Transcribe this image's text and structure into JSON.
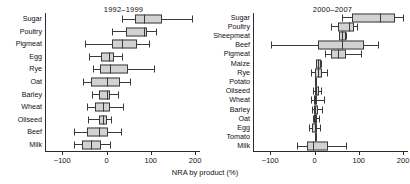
{
  "figure": {
    "xlabel": "NRA by product (%)"
  },
  "chart_data": [
    {
      "type": "box",
      "title": "1992–1999",
      "panel": "left",
      "xlabel": "NRA by product (%)",
      "ylabel": "",
      "xlim": [
        -140,
        210
      ],
      "xticks": [
        -100,
        0,
        100,
        200
      ],
      "xticklabels": [
        "−100",
        "0",
        "100",
        "200"
      ],
      "grid": false,
      "categories": [
        "Sugar",
        "Poultry",
        "Pigmeat",
        "Egg",
        "Rye",
        "Oat",
        "Barley",
        "Wheat",
        "Oilseed",
        "Beef",
        "Milk"
      ],
      "boxes": [
        {
          "label": "Sugar",
          "whisker_low": 36,
          "q1": 65,
          "median": 84,
          "q3": 126,
          "whisker_high": 192
        },
        {
          "label": "Poultry",
          "whisker_low": 12,
          "q1": 45,
          "median": 84,
          "q3": 92,
          "whisker_high": 111
        },
        {
          "label": "Pigmeat",
          "whisker_low": -48,
          "q1": 13,
          "median": 34,
          "q3": 69,
          "whisker_high": 95
        },
        {
          "label": "Egg",
          "whisker_low": -39,
          "q1": -12,
          "median": 5,
          "q3": 18,
          "whisker_high": 34
        },
        {
          "label": "Rye",
          "whisker_low": -30,
          "q1": -14,
          "median": 9,
          "q3": 49,
          "whisker_high": 107
        },
        {
          "label": "Oat",
          "whisker_low": -53,
          "q1": -35,
          "median": 0,
          "q3": 30,
          "whisker_high": 53
        },
        {
          "label": "Barley",
          "whisker_low": -33,
          "q1": -16,
          "median": 0,
          "q3": 9,
          "whisker_high": 26
        },
        {
          "label": "Wheat",
          "whisker_low": -45,
          "q1": -25,
          "median": -8,
          "q3": 9,
          "whisker_high": 38
        },
        {
          "label": "Oilseed",
          "whisker_low": -41,
          "q1": -18,
          "median": -8,
          "q3": 1,
          "whisker_high": 11
        },
        {
          "label": "Beef",
          "whisker_low": -74,
          "q1": -43,
          "median": -18,
          "q3": 3,
          "whisker_high": 32
        },
        {
          "label": "Milk",
          "whisker_low": -74,
          "q1": -55,
          "median": -35,
          "q3": -12,
          "whisker_high": 7
        }
      ]
    },
    {
      "type": "box",
      "title": "2000–2007",
      "panel": "right",
      "xlabel": "NRA by product (%)",
      "ylabel": "",
      "xlim": [
        -140,
        210
      ],
      "xticks": [
        -100,
        0,
        100,
        200
      ],
      "xticklabels": [
        "−100",
        "0",
        "100",
        "200"
      ],
      "grid": false,
      "categories": [
        "Sugar",
        "Poultry",
        "Sheepmeat",
        "Beef",
        "Pigmeat",
        "Maize",
        "Rye",
        "Potato",
        "Oilseed",
        "Wheat",
        "Barley",
        "Oat",
        "Egg",
        "Tomato",
        "Milk"
      ],
      "boxes": [
        {
          "label": "Sugar",
          "whisker_low": 63,
          "q1": 85,
          "median": 147,
          "q3": 182,
          "whisker_high": 200
        },
        {
          "label": "Poultry",
          "whisker_low": 38,
          "q1": 54,
          "median": 78,
          "q3": 89,
          "whisker_high": 97
        },
        {
          "label": "Sheepmeat",
          "whisker_low": 56,
          "q1": 56,
          "median": 63,
          "q3": 72,
          "whisker_high": 72
        },
        {
          "label": "Beef",
          "whisker_low": -99,
          "q1": 7,
          "median": 63,
          "q3": 112,
          "whisker_high": 144
        },
        {
          "label": "Pigmeat",
          "whisker_low": 24,
          "q1": 37,
          "median": 52,
          "q3": 72,
          "whisker_high": 104
        },
        {
          "label": "Maize",
          "whisker_low": 3,
          "q1": 3,
          "median": 8,
          "q3": 14,
          "whisker_high": 14
        },
        {
          "label": "Rye",
          "whisker_low": -9,
          "q1": 1,
          "median": 8,
          "q3": 17,
          "whisker_high": 28
        },
        {
          "label": "Potato",
          "whisker_low": 1,
          "q1": 1,
          "median": 1,
          "q3": 1,
          "whisker_high": 1
        },
        {
          "label": "Oilseed",
          "whisker_low": -4,
          "q1": 0,
          "median": 4,
          "q3": 10,
          "whisker_high": 14
        },
        {
          "label": "Wheat",
          "whisker_low": -7,
          "q1": -2,
          "median": 2,
          "q3": 6,
          "whisker_high": 22
        },
        {
          "label": "Barley",
          "whisker_low": -6,
          "q1": -2,
          "median": 2,
          "q3": 7,
          "whisker_high": 18
        },
        {
          "label": "Oat",
          "whisker_low": -4,
          "q1": -1,
          "median": 2,
          "q3": 6,
          "whisker_high": 10
        },
        {
          "label": "Egg",
          "whisker_low": -13,
          "q1": -6,
          "median": 0,
          "q3": 5,
          "whisker_high": 13
        },
        {
          "label": "Tomato",
          "whisker_low": 0,
          "q1": 0,
          "median": 0,
          "q3": 0,
          "whisker_high": 0
        },
        {
          "label": "Milk",
          "whisker_low": -39,
          "q1": -16,
          "median": -4,
          "q3": 30,
          "whisker_high": 72
        }
      ]
    }
  ]
}
